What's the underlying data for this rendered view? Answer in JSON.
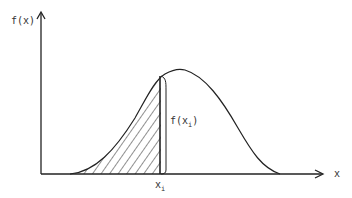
{
  "diagram": {
    "type": "probability-density-cdf-illustration",
    "y_axis_label": "f(x)",
    "x_axis_label": "x",
    "marker_label": "x",
    "marker_subscript": "i",
    "height_label_prefix": "f(x",
    "height_label_subscript": "i",
    "height_label_suffix": ")",
    "shaded_region": "area under curve from left tail up to x_i (hatched)",
    "colors": {
      "stroke": "#222222",
      "background": "#ffffff"
    }
  }
}
